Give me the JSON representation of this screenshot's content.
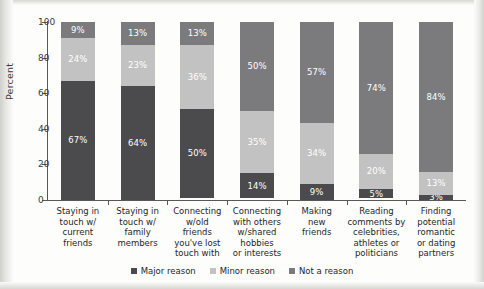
{
  "axis": {
    "ylabel": "Percent",
    "yticks": [
      "0",
      "20",
      "40",
      "60",
      "80",
      "100"
    ]
  },
  "legend": {
    "items": [
      {
        "label": "Major reason",
        "color": "#4b4b4d"
      },
      {
        "label": "Minor reason",
        "color": "#c2c2c2"
      },
      {
        "label": "Not a reason",
        "color": "#7b7b7d"
      }
    ]
  },
  "chart_data": {
    "type": "bar",
    "subtype": "stacked-100-percent",
    "title": "",
    "xlabel": "",
    "ylabel": "Percent",
    "ylim": [
      0,
      100
    ],
    "yticks": [
      0,
      20,
      40,
      60,
      80,
      100
    ],
    "grid": false,
    "legend_position": "bottom",
    "categories": [
      "Staying in touch w/ current friends",
      "Staying in touch w/ family members",
      "Connecting w/old friends you've lost touch with",
      "Connecting with others w/shared hobbies or interests",
      "Making new friends",
      "Reading comments by celebrities, athletes or politicians",
      "Finding potential romantic or dating partners"
    ],
    "category_lines": [
      [
        "Staying in",
        "touch w/",
        "current",
        "friends"
      ],
      [
        "Staying in",
        "touch w/",
        "family",
        "members"
      ],
      [
        "Connecting",
        "w/old",
        "friends",
        "you've lost",
        "touch with"
      ],
      [
        "Connecting",
        "with others",
        "w/shared",
        "hobbies",
        "or interests"
      ],
      [
        "Making",
        "new",
        "friends"
      ],
      [
        "Reading",
        "comments by",
        "celebrities,",
        "athletes or",
        "politicians"
      ],
      [
        "Finding",
        "potential",
        "romantic",
        "or dating",
        "partners"
      ]
    ],
    "series": [
      {
        "name": "Major reason",
        "color": "#4b4b4d",
        "values": [
          67,
          64,
          50,
          14,
          9,
          5,
          3
        ]
      },
      {
        "name": "Minor reason",
        "color": "#c2c2c2",
        "values": [
          24,
          23,
          36,
          35,
          34,
          20,
          13
        ]
      },
      {
        "name": "Not a reason",
        "color": "#7b7b7d",
        "values": [
          9,
          13,
          13,
          50,
          57,
          74,
          84
        ]
      }
    ],
    "data_labels": [
      {
        "category": "Staying in touch w/ current friends",
        "Major reason": "67%",
        "Minor reason": "24%",
        "Not a reason": "9%"
      },
      {
        "category": "Staying in touch w/ family members",
        "Major reason": "64%",
        "Minor reason": "23%",
        "Not a reason": "13%"
      },
      {
        "category": "Connecting w/old friends you've lost touch with",
        "Major reason": "50%",
        "Minor reason": "36%",
        "Not a reason": "13%"
      },
      {
        "category": "Connecting with others w/shared hobbies or interests",
        "Major reason": "14%",
        "Minor reason": "35%",
        "Not a reason": "50%"
      },
      {
        "category": "Making new friends",
        "Major reason": "9%",
        "Minor reason": "34%",
        "Not a reason": "57%"
      },
      {
        "category": "Reading comments by celebrities, athletes or politicians",
        "Major reason": "5%",
        "Minor reason": "20%",
        "Not a reason": "74%"
      },
      {
        "category": "Finding potential romantic or dating partners",
        "Major reason": "3%",
        "Minor reason": "13%",
        "Not a reason": "84%"
      }
    ]
  }
}
